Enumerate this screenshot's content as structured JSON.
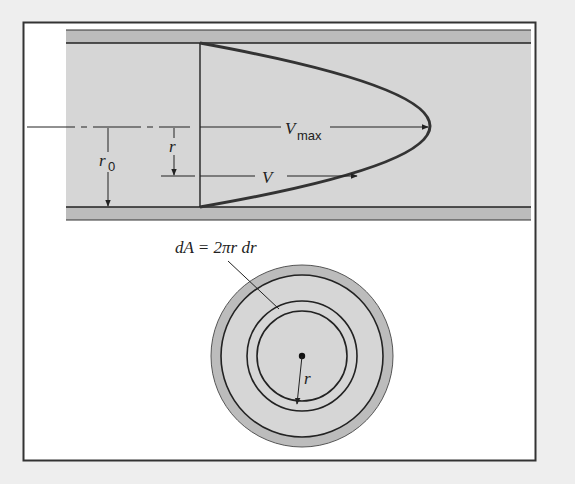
{
  "figure": {
    "colors": {
      "page_background": "#eeeeee",
      "frame_fill": "#ffffff",
      "frame_stroke": "#333333",
      "fluid_fill": "#d6d6d6",
      "wall_fill": "#bcbcbc",
      "line": "#222222",
      "profile_curve": "#333333"
    },
    "pipe_view": {
      "labels": {
        "vmax_symbol": "V",
        "vmax_subscript": "max",
        "v_symbol": "V",
        "r_symbol": "r",
        "r0_symbol": "r",
        "r0_subscript": "0"
      }
    },
    "cross_section": {
      "area_equation": "dA = 2πr dr",
      "radius_label": "r"
    }
  }
}
